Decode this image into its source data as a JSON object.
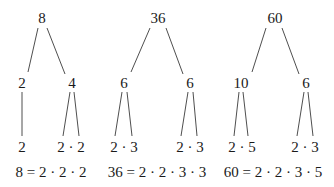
{
  "trees": [
    {
      "root": "8",
      "level1": [
        "2",
        "4"
      ],
      "level2": [
        "2",
        "2 · 2"
      ],
      "equation": "8 = 2 · 2 · 2"
    },
    {
      "root": "36",
      "level1": [
        "6",
        "6"
      ],
      "level2": [
        "2 · 3",
        "2 · 3"
      ],
      "equation": "36 = 2 · 2 · 3 · 3"
    },
    {
      "root": "60",
      "level1": [
        "10",
        "6"
      ],
      "level2": [
        "2 · 5",
        "2 · 3"
      ],
      "equation": "60 = 2 · 2 · 3 · 5"
    }
  ],
  "colors": {
    "text": "#1a1a1a",
    "line": "#3a3a3a",
    "background": "#ffffff"
  }
}
